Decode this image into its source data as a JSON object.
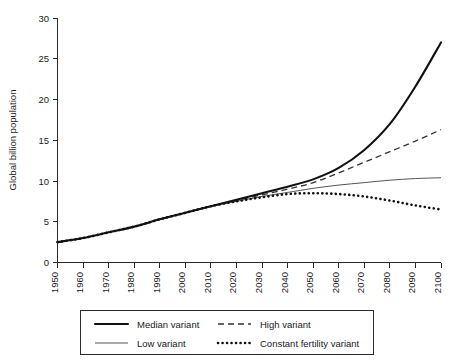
{
  "chart_data": {
    "type": "line",
    "title": "",
    "xlabel": "",
    "ylabel": "Global billion population",
    "xlim": [
      1950,
      2100
    ],
    "ylim": [
      0,
      30
    ],
    "grid": false,
    "legend_position": "bottom",
    "xticks": [
      "1950",
      "1960",
      "1970",
      "1980",
      "1990",
      "2000",
      "2010",
      "2020",
      "2030",
      "2040",
      "2050",
      "2060",
      "2070",
      "2080",
      "2090",
      "2100"
    ],
    "yticks": [
      "0",
      "5",
      "10",
      "15",
      "20",
      "25",
      "30"
    ],
    "x": [
      1950,
      1960,
      1970,
      1980,
      1990,
      2000,
      2010,
      2020,
      2030,
      2040,
      2050,
      2060,
      2070,
      2080,
      2090,
      2100
    ],
    "series": [
      {
        "name": "Median variant",
        "style": "solid-thick",
        "color": "#111111",
        "values": [
          2.5,
          3.0,
          3.7,
          4.4,
          5.3,
          6.1,
          6.9,
          7.7,
          8.5,
          9.3,
          10.2,
          11.6,
          13.8,
          17.0,
          21.6,
          27.0
        ]
      },
      {
        "name": "High variant",
        "style": "dashed",
        "color": "#333333",
        "values": [
          2.5,
          3.0,
          3.7,
          4.4,
          5.3,
          6.1,
          6.9,
          7.6,
          8.3,
          9.0,
          9.8,
          11.0,
          12.3,
          13.6,
          14.9,
          16.3
        ]
      },
      {
        "name": "Low variant",
        "style": "solid-thin",
        "color": "#555555",
        "values": [
          2.5,
          3.0,
          3.7,
          4.4,
          5.3,
          6.1,
          6.9,
          7.5,
          8.1,
          8.6,
          9.1,
          9.5,
          9.8,
          10.1,
          10.3,
          10.4
        ]
      },
      {
        "name": "Constant fertility variant",
        "style": "dotted",
        "color": "#111111",
        "values": [
          2.5,
          3.0,
          3.7,
          4.4,
          5.3,
          6.1,
          6.9,
          7.5,
          8.0,
          8.4,
          8.5,
          8.4,
          8.1,
          7.6,
          7.0,
          6.5
        ]
      }
    ]
  },
  "legend": {
    "entries": [
      {
        "label": "Median variant"
      },
      {
        "label": "High variant"
      },
      {
        "label": "Low variant"
      },
      {
        "label": "Constant fertility variant"
      }
    ]
  }
}
